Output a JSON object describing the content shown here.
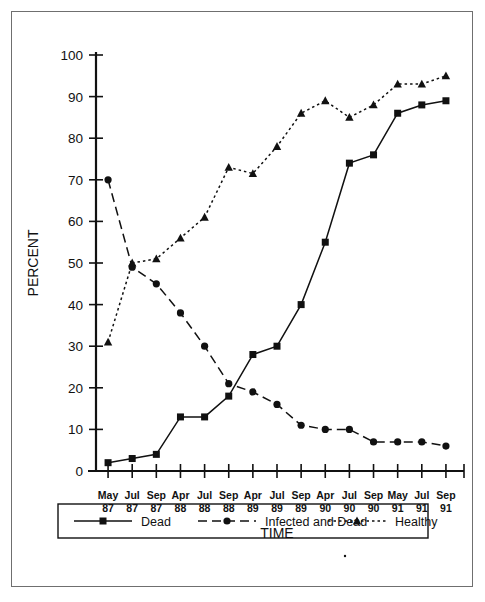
{
  "figure": {
    "border_color": "#6f6f6f",
    "background": "#ffffff"
  },
  "axis": {
    "y_label": "PERCENT",
    "x_label": "TIME",
    "y_ticks": [
      "0",
      "10",
      "20",
      "30",
      "40",
      "50",
      "60",
      "70",
      "80",
      "90",
      "100"
    ],
    "x_ticks_top": [
      "May",
      "Jul",
      "Sep",
      "Apr",
      "Jul",
      "Sep",
      "Apr",
      "Jul",
      "Sep",
      "Apr",
      "Jul",
      "Sep",
      "May",
      "Jul",
      "Sep"
    ],
    "x_ticks_bottom": [
      "87",
      "87",
      "87",
      "88",
      "88",
      "88",
      "89",
      "89",
      "89",
      "90",
      "90",
      "90",
      "91",
      "91",
      "91"
    ]
  },
  "legend": {
    "items": [
      {
        "label": "Dead",
        "marker": "square",
        "dash": "solid",
        "color": "#111111"
      },
      {
        "label": "Infected and Dead",
        "marker": "circle",
        "dash": "dashed",
        "color": "#111111"
      },
      {
        "label": "Healthy",
        "marker": "triangle",
        "dash": "dotted",
        "color": "#111111"
      }
    ]
  },
  "chart_data": {
    "type": "line",
    "title": "",
    "xlabel": "TIME",
    "ylabel": "PERCENT",
    "ylim": [
      0,
      100
    ],
    "ytick_step": 10,
    "grid": false,
    "legend_position": "bottom",
    "categories": [
      "May 87",
      "Jul 87",
      "Sep 87",
      "Apr 88",
      "Jul 88",
      "Sep 88",
      "Apr 89",
      "Jul 89",
      "Sep 89",
      "Apr 90",
      "Jul 90",
      "Sep 90",
      "May 91",
      "Jul 91",
      "Sep 91"
    ],
    "series": [
      {
        "name": "Dead",
        "marker": "square",
        "dash": "solid",
        "color": "#111111",
        "values": [
          2,
          3,
          4,
          13,
          13,
          18,
          28,
          30,
          40,
          55,
          74,
          76,
          86,
          88,
          89
        ]
      },
      {
        "name": "Infected and Dead",
        "marker": "circle",
        "dash": "dashed",
        "color": "#111111",
        "values": [
          70,
          49,
          45,
          38,
          30,
          21,
          19,
          16,
          11,
          10,
          10,
          7,
          7,
          7,
          6
        ]
      },
      {
        "name": "Healthy",
        "marker": "triangle",
        "dash": "dotted",
        "color": "#111111",
        "values": [
          31,
          50,
          51,
          56,
          61,
          73,
          71.5,
          78,
          86,
          89,
          85,
          88,
          93,
          93,
          95
        ]
      }
    ]
  }
}
